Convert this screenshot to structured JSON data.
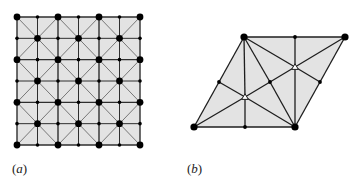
{
  "figure": {
    "panels": [
      {
        "id": "a",
        "label": "a",
        "type": "square-grid-mesh",
        "description": "6x6 square grid with triangulated 2x2 blocks; large nodes at block corners and block centers, small nodes elsewhere",
        "grid": {
          "cols": 6,
          "rows": 6,
          "x0": 17,
          "y0": 17,
          "x1": 140,
          "y1": 145
        },
        "colors": {
          "fill": "#e3e3e3",
          "grid_line": "#2e2e2e",
          "diagonal_line": "#777777",
          "node": "#000000"
        }
      },
      {
        "id": "b",
        "label": "b",
        "type": "rhombus-mesh",
        "description": "Rhombus cell triangulated around two open triangle-marked interior points",
        "vertices": {
          "TL": [
            244,
            37
          ],
          "TR": [
            345,
            37
          ],
          "BR": [
            295,
            127
          ],
          "BL": [
            194,
            127
          ],
          "top_mid": [
            295,
            37
          ],
          "bottom_mid": [
            245,
            127
          ],
          "left_mid": [
            219,
            82
          ],
          "right_mid": [
            320,
            82
          ],
          "center": [
            270,
            82
          ],
          "tri_upper": [
            295,
            67
          ],
          "tri_lower": [
            245,
            97
          ]
        },
        "large_nodes": [
          "TL",
          "TR",
          "BR",
          "BL"
        ],
        "small_nodes": [
          "top_mid",
          "bottom_mid",
          "left_mid",
          "right_mid",
          "center"
        ],
        "open_markers": [
          "tri_upper",
          "tri_lower"
        ],
        "edges": [
          [
            "TL",
            "top_mid"
          ],
          [
            "top_mid",
            "TR"
          ],
          [
            "TR",
            "right_mid"
          ],
          [
            "right_mid",
            "BR"
          ],
          [
            "BR",
            "bottom_mid"
          ],
          [
            "bottom_mid",
            "BL"
          ],
          [
            "BL",
            "left_mid"
          ],
          [
            "left_mid",
            "TL"
          ],
          [
            "TL",
            "tri_lower"
          ],
          [
            "tri_lower",
            "bottom_mid"
          ],
          [
            "top_mid",
            "tri_upper"
          ],
          [
            "tri_upper",
            "BR"
          ],
          [
            "TL",
            "center"
          ],
          [
            "center",
            "BR"
          ],
          [
            "TL",
            "tri_upper"
          ],
          [
            "tri_upper",
            "TR"
          ],
          [
            "BL",
            "tri_lower"
          ],
          [
            "tri_lower",
            "BR"
          ],
          [
            "left_mid",
            "tri_lower"
          ],
          [
            "tri_upper",
            "right_mid"
          ],
          [
            "tri_lower",
            "center"
          ],
          [
            "center",
            "tri_upper"
          ]
        ],
        "colors": {
          "fill": "#e3e3e3",
          "line": "#1e1e1e",
          "node": "#000000",
          "marker_fill": "#ffffff"
        }
      }
    ],
    "labels": {
      "a": "a",
      "b": "b",
      "open": "(",
      "close": ")"
    }
  }
}
